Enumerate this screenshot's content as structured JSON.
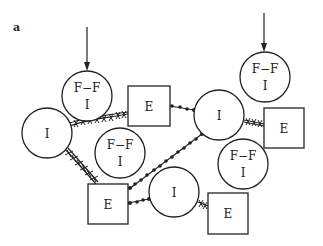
{
  "figure": {
    "panel_label": "a",
    "colors": {
      "stroke": "#222222",
      "background": "#ffffff"
    }
  },
  "nodes": [
    {
      "id": "ffi_top_left",
      "type": "circle",
      "line1": "F−F",
      "line2": "I",
      "cx": 87,
      "cy": 96,
      "r": 25
    },
    {
      "id": "e_top",
      "type": "square",
      "label": "E",
      "x": 128,
      "y": 86,
      "w": 42,
      "h": 40
    },
    {
      "id": "i_left",
      "type": "circle",
      "label": "I",
      "cx": 47,
      "cy": 133,
      "r": 25
    },
    {
      "id": "ffi_middle",
      "type": "circle",
      "line1": "F−F",
      "line2": "I",
      "cx": 120,
      "cy": 153,
      "r": 25
    },
    {
      "id": "i_right",
      "type": "circle",
      "label": "I",
      "cx": 219,
      "cy": 115,
      "r": 25
    },
    {
      "id": "e_right",
      "type": "square",
      "label": "E",
      "x": 264,
      "y": 108,
      "w": 40,
      "h": 40
    },
    {
      "id": "ffi_top_right",
      "type": "circle",
      "line1": "F−F",
      "line2": "I",
      "cx": 265,
      "cy": 77,
      "r": 25
    },
    {
      "id": "ffi_right_lower",
      "type": "circle",
      "line1": "F−F",
      "line2": "I",
      "cx": 243,
      "cy": 164,
      "r": 25
    },
    {
      "id": "e_bottom_left",
      "type": "square",
      "label": "E",
      "x": 88,
      "y": 184,
      "w": 40,
      "h": 40
    },
    {
      "id": "i_bottom",
      "type": "circle",
      "label": "I",
      "cx": 174,
      "cy": 192,
      "r": 25
    },
    {
      "id": "e_bottom_right",
      "type": "square",
      "label": "E",
      "x": 208,
      "y": 193,
      "w": 40,
      "h": 41
    }
  ],
  "arrows": [
    {
      "id": "arrow_top_left",
      "target": "ffi_top_left",
      "x": 87,
      "y1": 27,
      "y2": 70
    },
    {
      "id": "arrow_top_right",
      "target": "ffi_top_right",
      "x": 264,
      "y1": 13,
      "y2": 51
    }
  ],
  "connections": [
    {
      "from": "i_left",
      "to": "e_top",
      "style": "cross-linked"
    },
    {
      "from": "i_left",
      "to": "e_bottom_left",
      "style": "cross-linked"
    },
    {
      "from": "e_top",
      "to": "i_right",
      "style": "beaded"
    },
    {
      "from": "i_right",
      "to": "e_bottom_left",
      "style": "beaded"
    },
    {
      "from": "i_right",
      "to": "e_right",
      "style": "cross-linked"
    },
    {
      "from": "e_bottom_left",
      "to": "i_bottom",
      "style": "beaded"
    },
    {
      "from": "i_bottom",
      "to": "e_bottom_right",
      "style": "cross-linked"
    }
  ]
}
